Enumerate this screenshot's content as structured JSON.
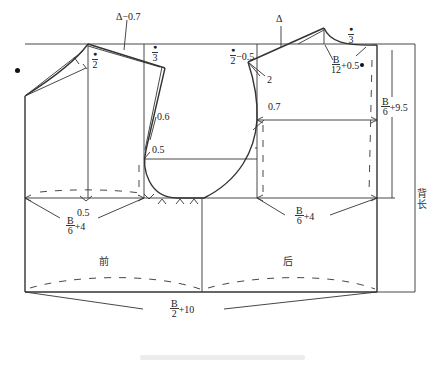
{
  "figure": {
    "type": "garment pattern draft - bodice block (front and back)",
    "panels": {
      "front_label": "前",
      "back_label": "后",
      "back_length_label": "背长"
    },
    "annotations": {
      "front_neck_shoulder_drop": "Δ−0.7",
      "back_shoulder_marker": "Δ",
      "front_neck_width_num": "●",
      "front_neck_width_den": "2",
      "front_chest_third_num": "●",
      "front_chest_third_den": "3",
      "back_neck_num": "●",
      "back_neck_den": "2",
      "back_neck_suffix": "−0.5",
      "back_shoulder_extension": "2",
      "back_neck_depth_num": "●",
      "back_neck_depth_den": "3",
      "back_neck_width_num": "B",
      "back_neck_width_den": "12",
      "back_neck_width_suffix": "+0.5",
      "back_armhole_depth_num": "B",
      "back_armhole_depth_den": "6",
      "back_armhole_depth_suffix": "+9.5",
      "front_armhole_curve_1": "0.6",
      "front_armhole_curve_2": "0.5",
      "back_armhole_curve": "0.7",
      "front_dart_offset": "0.5",
      "front_width_num": "B",
      "front_width_den": "6",
      "front_width_suffix": "+4",
      "back_width_num": "B",
      "back_width_den": "6",
      "back_width_suffix": "+4",
      "total_width_num": "B",
      "total_width_den": "2",
      "total_width_suffix": "+10"
    },
    "colors": {
      "line": "#222222",
      "thin_line": "#444444",
      "background": "#ffffff"
    }
  }
}
